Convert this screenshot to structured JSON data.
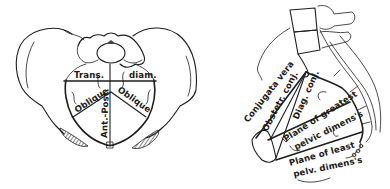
{
  "figure": {
    "left_view": {
      "name": "pelvic inlet superior view",
      "labels": {
        "trans": "Trans.",
        "diam": "diam.",
        "oblique_left": "Oblique",
        "oblique_right": "Oblique",
        "ant_post": "Ant.-Post."
      }
    },
    "right_view": {
      "name": "sagittal section of pelvis",
      "labels": {
        "conjugata_vera": "Conjugata vera",
        "obstetr_conj": "Obstetr. conj.",
        "diag_conj": "Diag. conj.",
        "plane_greatest_1": "Plane of greatest",
        "plane_greatest_2": "pelvic dimens's",
        "plane_least_1": "Plane of least",
        "plane_least_2": "pelv. dimens's"
      }
    },
    "colors": {
      "line": "#1e1e1e",
      "background": "#ffffff"
    }
  }
}
